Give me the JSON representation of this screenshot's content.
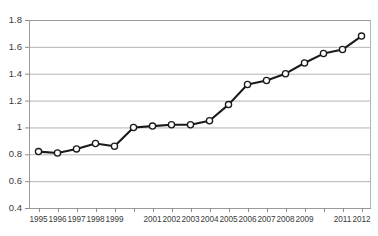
{
  "chart_data": {
    "type": "line",
    "title": "",
    "subtitle": "",
    "xlabel": "",
    "ylabel": "",
    "grid": true,
    "grid_axis": "y",
    "legend": false,
    "legend_position": "none",
    "ylim": [
      0.4,
      1.8
    ],
    "yticks": [
      0.4,
      0.6,
      0.8,
      1,
      1.2,
      1.4,
      1.6,
      1.8
    ],
    "ytick_labels": [
      "0.4",
      "0.6",
      "0.8",
      "1",
      "1.2",
      "1.4",
      "1.6",
      "1.8"
    ],
    "x": [
      1995,
      1996,
      1997,
      1998,
      1999,
      2000,
      2001,
      2002,
      2003,
      2004,
      2005,
      2006,
      2007,
      2008,
      2009,
      2010,
      2011,
      2012
    ],
    "xtick_labels": [
      "1995",
      "1996",
      "1997",
      "1998",
      "1999",
      "",
      "2001",
      "2002",
      "2003",
      "2004",
      "2005",
      "2006",
      "2007",
      "2008",
      "2009",
      "",
      "2011",
      "2012"
    ],
    "values": [
      0.82,
      0.81,
      0.84,
      0.88,
      0.86,
      1.0,
      1.01,
      1.02,
      1.02,
      1.05,
      1.17,
      1.32,
      1.35,
      1.4,
      1.48,
      1.55,
      1.58,
      1.68
    ],
    "series": [
      {
        "name": "",
        "values": [
          0.82,
          0.81,
          0.84,
          0.88,
          0.86,
          1.0,
          1.01,
          1.02,
          1.02,
          1.05,
          1.17,
          1.32,
          1.35,
          1.4,
          1.48,
          1.55,
          1.58,
          1.68
        ]
      }
    ],
    "marker": "open-circle",
    "annotations": []
  },
  "style": {
    "line_color": "#1a1a1a",
    "marker_fill": "#ffffff",
    "marker_stroke": "#1a1a1a",
    "grid_color": "#b4b4b4",
    "axis_color": "#9a9a9a",
    "tick_color": "#8c8c8c",
    "label_color": "#3a3a3a",
    "plot_background": "#ffffff"
  }
}
